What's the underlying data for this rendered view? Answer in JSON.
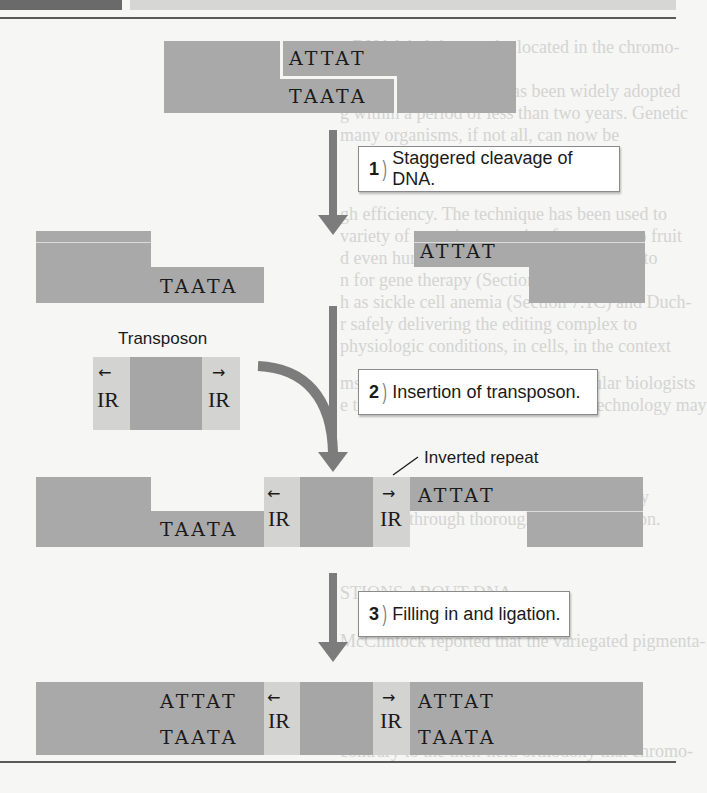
{
  "page": {
    "header_bar": {
      "dark_color": "#6a6a6a",
      "light_color": "#d6d6d4"
    },
    "ghost_text_lines": [
      "e DNA label that can be located in the chromo-",
      "nce microscope.",
      "R–Cas9-based editing has been widely adopted",
      "g within a period of less than two years. Genetic",
      "many organisms, if not all, can now be",
      "gh efficiency. The technique has been used to",
      "variety of organisms ranging from yeast to fruit",
      "d even human cells. Efforts are underway to",
      "n for gene therapy (Section 3.5), such as",
      "h as sickle cell anemia (Section 7.1C) and Duch-",
      "r safely delivering the editing complex to",
      "physiologic conditions, in cells, in the context",
      "ms has motivated a group of molecular biologists",
      "e technique. While CRISPR–Cas9 technology may",
      "onal, it will need to be used with the safety",
      "ng tested through thorough experimentation.",
      "",
      "",
      "",
      "STIONS ABOUT DNA",
      "",
      "McClintock reported that the variegated pigmenta-",
      "",
      "",
      "contrary to the then-held orthodoxy that chromo-"
    ]
  },
  "figure": {
    "colors": {
      "dna": "#a9a9a9",
      "inverted_repeat": "#d3d3d1",
      "transposon_core": "#a6a6a6",
      "arrow": "#7c7c7c"
    },
    "stage0": {
      "top_seq": "ATTAT",
      "bottom_seq": "TAATA"
    },
    "step1": {
      "number": "1",
      "text": "Staggered cleavage of DNA."
    },
    "stage1": {
      "right_top_seq": "ATTAT",
      "left_bottom_seq": "TAATA"
    },
    "transposon": {
      "label": "Transposon",
      "left_ir": "IR",
      "right_ir": "IR",
      "left_arrow": "←",
      "right_arrow": "→"
    },
    "step2": {
      "number": "2",
      "text": "Insertion of transposon."
    },
    "inverted_repeat_label": "Inverted repeat",
    "stage2": {
      "left_bottom_seq": "TAATA",
      "right_top_seq": "ATTAT",
      "left_ir": "IR",
      "right_ir": "IR",
      "left_arrow": "←",
      "right_arrow": "→"
    },
    "step3": {
      "number": "3",
      "text": "Filling in and ligation."
    },
    "stage3": {
      "left_top_seq": "ATTAT",
      "left_bottom_seq": "TAATA",
      "right_top_seq": "ATTAT",
      "right_bottom_seq": "TAATA",
      "left_ir": "IR",
      "right_ir": "IR",
      "left_arrow": "←",
      "right_arrow": "→"
    }
  }
}
